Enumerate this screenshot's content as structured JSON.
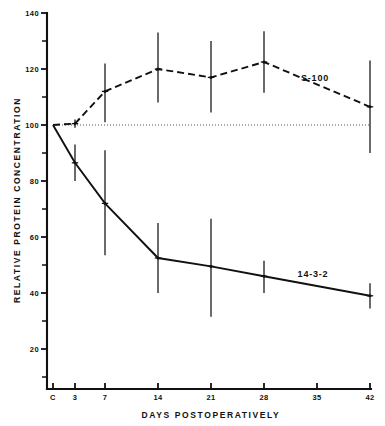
{
  "chart_data": {
    "type": "line",
    "title": "",
    "xlabel": "DAYS POSTOPERATIVELY",
    "ylabel": "RELATIVE PROTEIN CONCENTRATION",
    "x": [
      0,
      3,
      7,
      14,
      21,
      28,
      42
    ],
    "x_tick_labels": [
      "C",
      "3",
      "7",
      "14",
      "21",
      "28",
      "35",
      "42"
    ],
    "x_tick_values": [
      0,
      3,
      7,
      14,
      21,
      28,
      35,
      42
    ],
    "xlim": [
      0,
      42
    ],
    "ylim": [
      0,
      140
    ],
    "y_tick_labels": [
      "20",
      "40",
      "60",
      "80",
      "100",
      "120",
      "140"
    ],
    "y_tick_values": [
      20,
      40,
      60,
      80,
      100,
      120,
      140
    ],
    "y_minor_ticks": [
      10,
      30,
      50,
      70,
      90,
      110,
      130
    ],
    "grid": false,
    "legend_position": "inline-right",
    "reference_line": {
      "y": 100,
      "style": "dotted"
    },
    "series": [
      {
        "name": "S-100",
        "label": "S-100",
        "style": "dashed",
        "label_x": 35.4,
        "label_y": 116,
        "values": [
          100,
          100.5,
          112,
          120,
          117,
          122.5,
          106.5
        ],
        "err_low": [
          100,
          99,
          101,
          108,
          104.5,
          111.5,
          90
        ],
        "err_high": [
          100,
          102,
          122,
          133,
          130,
          133.5,
          123
        ]
      },
      {
        "name": "14-3-2",
        "label": "14-3-2",
        "style": "solid",
        "label_x": 35.6,
        "label_y": 46,
        "values": [
          100,
          86.5,
          72,
          52.5,
          49.5,
          46,
          39
        ],
        "err_low": [
          100,
          80,
          53.5,
          40,
          31.5,
          40,
          34.5
        ],
        "err_high": [
          100,
          93,
          91,
          65,
          66.5,
          51.5,
          43.5
        ]
      }
    ]
  },
  "axes": {
    "x_title": "DAYS POSTOPERATIVELY",
    "y_title": "RELATIVE PROTEIN CONCENTRATION"
  },
  "labels": {
    "y_140": "140",
    "y_120": "120",
    "y_100": "100",
    "y_80": "80",
    "y_60": "60",
    "y_40": "40",
    "y_20": "20",
    "x_c": "C",
    "x_3": "3",
    "x_7": "7",
    "x_14": "14",
    "x_21": "21",
    "x_28": "28",
    "x_35": "35",
    "x_42": "42",
    "series_s100": "S-100",
    "series_1432": "14-3-2"
  },
  "colors": {
    "ink": "#111111",
    "background": "#ffffff",
    "reference": "#555555"
  }
}
